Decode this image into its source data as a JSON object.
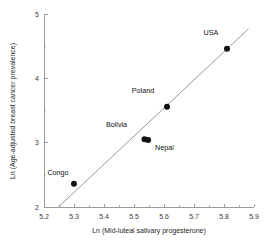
{
  "chart_data": {
    "type": "scatter",
    "title": "",
    "xlabel": "Ln (Mid-luteal salivary progesterone)",
    "ylabel": "Ln (Age-adjusted breast cancer prevalence)",
    "xlim": [
      5.2,
      5.9
    ],
    "ylim": [
      2,
      5
    ],
    "xticks": [
      5.2,
      5.3,
      5.4,
      5.5,
      5.6,
      5.7,
      5.8,
      5.9
    ],
    "xtick_labels": [
      "5.2",
      "5.3",
      "5.4",
      "5.5",
      "5.6",
      "5.7",
      "5.8",
      "5.9"
    ],
    "xticks_minor": [
      5.25,
      5.35,
      5.45,
      5.55,
      5.65,
      5.75,
      5.85
    ],
    "yticks": [
      2,
      3,
      4,
      5
    ],
    "ytick_labels": [
      "2",
      "3",
      "4",
      "5"
    ],
    "yticks_minor": [
      2.5,
      3.5,
      4.5
    ],
    "grid": false,
    "legend": false,
    "points": [
      {
        "label": "Congo",
        "x": 5.3,
        "y": 2.36,
        "label_dx": -16,
        "label_dy": -9,
        "label_anchor": "middle"
      },
      {
        "label": "Bolivia",
        "x": 5.535,
        "y": 3.055,
        "label_dx": -28,
        "label_dy": -12,
        "label_anchor": "middle"
      },
      {
        "label": "Nepal",
        "x": 5.547,
        "y": 3.04,
        "label_dx": 7,
        "label_dy": 10,
        "label_anchor": "start"
      },
      {
        "label": "Poland",
        "x": 5.61,
        "y": 3.56,
        "label_dx": -24,
        "label_dy": -14,
        "label_anchor": "middle"
      },
      {
        "label": "USA",
        "x": 5.81,
        "y": 4.46,
        "label_dx": -16,
        "label_dy": -14,
        "label_anchor": "middle"
      }
    ],
    "fit_line": {
      "name": "regression-line",
      "x1": 5.248,
      "y1": 2.0,
      "x2": 5.882,
      "y2": 4.77,
      "color": "#8c8c8c"
    },
    "colors": {
      "point": "#111111",
      "axis": "#9a9a9a",
      "text": "#232323",
      "background": "#ffffff"
    }
  }
}
